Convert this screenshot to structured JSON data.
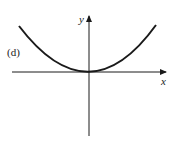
{
  "figure": {
    "panel_label": "(d)",
    "x_axis_label": "x",
    "y_axis_label": "y",
    "curve": "parabola opening upward with vertex at origin (y = kx^2)",
    "colors": {
      "ink": "#1a1a1a",
      "background": "#ffffff"
    }
  }
}
